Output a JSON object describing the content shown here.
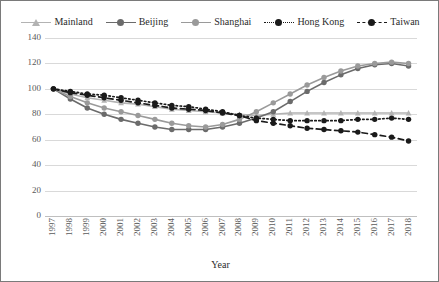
{
  "chart_data": {
    "type": "line",
    "title": "",
    "xlabel": "Year",
    "ylabel": "",
    "ylim": [
      0,
      140
    ],
    "ytick_step": 20,
    "grid": true,
    "legend_position": "top",
    "categories": [
      "1997",
      "1998",
      "1999",
      "2000",
      "2001",
      "2002",
      "2003",
      "2004",
      "2005",
      "2006",
      "2007",
      "2008",
      "2009",
      "2010",
      "2011",
      "2012",
      "2013",
      "2014",
      "2015",
      "2016",
      "2017",
      "2018"
    ],
    "yticks": [
      "0",
      "20",
      "40",
      "60",
      "80",
      "100",
      "120",
      "140"
    ],
    "series": [
      {
        "name": "Mainland",
        "color": "#b3b3b3",
        "marker": "triangle",
        "dash": "solid",
        "values": [
          100,
          96,
          93,
          91,
          89,
          88,
          86,
          84,
          83,
          82,
          81,
          80,
          79,
          80,
          81,
          81,
          81,
          81,
          81,
          81,
          81,
          81
        ]
      },
      {
        "name": "Beijing",
        "color": "#6b6b6b",
        "marker": "circle",
        "dash": "solid",
        "values": [
          100,
          92,
          85,
          80,
          76,
          73,
          70,
          68,
          68,
          68,
          70,
          73,
          77,
          82,
          90,
          98,
          105,
          111,
          116,
          119,
          120,
          118
        ]
      },
      {
        "name": "Shanghai",
        "color": "#9a9a9a",
        "marker": "circle",
        "dash": "solid",
        "values": [
          100,
          94,
          89,
          85,
          82,
          79,
          76,
          73,
          71,
          70,
          72,
          76,
          82,
          89,
          96,
          103,
          109,
          114,
          118,
          120,
          121,
          120
        ]
      },
      {
        "name": "Hong Kong",
        "color": "#1a1a1a",
        "marker": "circle",
        "dash": "dotted",
        "values": [
          100,
          98,
          96,
          95,
          93,
          91,
          89,
          87,
          86,
          84,
          82,
          79,
          77,
          76,
          75,
          75,
          75,
          75,
          76,
          76,
          77,
          76
        ]
      },
      {
        "name": "Taiwan",
        "color": "#1a1a1a",
        "marker": "circle",
        "dash": "dashed",
        "values": [
          100,
          97,
          95,
          93,
          91,
          89,
          87,
          85,
          84,
          83,
          81,
          79,
          75,
          73,
          71,
          69,
          68,
          67,
          66,
          64,
          62,
          59
        ]
      }
    ]
  }
}
